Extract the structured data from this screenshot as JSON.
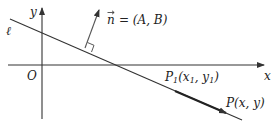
{
  "diagram": {
    "labels": {
      "y_axis": "y",
      "x_axis": "x",
      "origin": "O",
      "line": "ℓ",
      "normal_vec_letter": "n",
      "normal_eq": "= (A, B)",
      "p1": "P",
      "p1_sub": "1",
      "p1_coords": "(x",
      "p1_coords_sub1": "1",
      "p1_coords_mid": ", y",
      "p1_coords_sub2": "1",
      "p1_coords_end": ")",
      "p": "P(x, y)"
    },
    "colors": {
      "stroke": "#333333",
      "background": "#ffffff"
    }
  }
}
